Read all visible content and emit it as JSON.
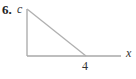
{
  "problem": {
    "number": "6.",
    "y_axis_label": "c",
    "x_axis_label": "x",
    "x_tick_label": "4"
  },
  "diagram": {
    "type": "line-segment graph",
    "segment": {
      "from": [
        0,
        "c"
      ],
      "to": [
        4,
        0
      ]
    },
    "line_color": "#b0b0b0",
    "axis_color": "#a0a0a0"
  }
}
